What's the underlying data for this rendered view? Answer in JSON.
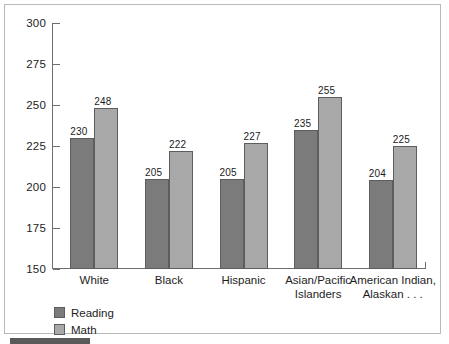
{
  "chart_data": {
    "type": "bar",
    "title": "",
    "xlabel": "",
    "ylabel": "",
    "ylim": [
      150,
      300
    ],
    "yticks": [
      150,
      175,
      200,
      225,
      250,
      275,
      300
    ],
    "grid": false,
    "legend_position": "bottom-left",
    "categories": [
      "White",
      "Black",
      "Hispanic",
      "Asian/Pacific Islanders",
      "American Indian, Alaskan . . ."
    ],
    "category_lines": [
      [
        "White"
      ],
      [
        "Black"
      ],
      [
        "Hispanic"
      ],
      [
        "Asian/Pacific",
        "Islanders"
      ],
      [
        "American Indian,",
        "Alaskan . . ."
      ]
    ],
    "series": [
      {
        "name": "Reading",
        "color": "#7b7b7b",
        "values": [
          230,
          205,
          205,
          235,
          204
        ]
      },
      {
        "name": "Math",
        "color": "#a8a8a8",
        "values": [
          248,
          222,
          227,
          255,
          225
        ]
      }
    ]
  },
  "axis": {
    "tick_labels": [
      "300",
      "275",
      "250",
      "225",
      "200",
      "175",
      "150"
    ]
  },
  "legend": {
    "items": [
      {
        "label": "Reading",
        "swatch": "reading"
      },
      {
        "label": "Math",
        "swatch": "math"
      }
    ]
  }
}
